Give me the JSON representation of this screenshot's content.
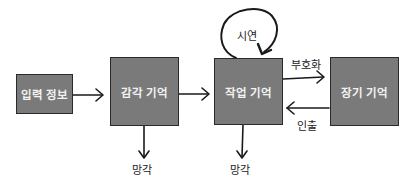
{
  "diagram": {
    "type": "memory-model-flow",
    "nodes": [
      {
        "id": "input",
        "label": "입력 정보"
      },
      {
        "id": "sensory",
        "label": "감각 기억"
      },
      {
        "id": "working",
        "label": "작업 기억"
      },
      {
        "id": "longterm",
        "label": "장기 기억"
      }
    ],
    "edges": [
      {
        "from": "input",
        "to": "sensory",
        "label": ""
      },
      {
        "from": "sensory",
        "to": "working",
        "label": ""
      },
      {
        "from": "working",
        "to": "working",
        "label": "시연"
      },
      {
        "from": "working",
        "to": "longterm",
        "label": "부호화"
      },
      {
        "from": "longterm",
        "to": "working",
        "label": "인출"
      },
      {
        "from": "sensory",
        "to": "forget",
        "label": "망각"
      },
      {
        "from": "working",
        "to": "forget",
        "label": "망각"
      }
    ],
    "labels": {
      "rehearsal": "시연",
      "encoding": "부호화",
      "retrieval": "인출",
      "forget_sensory": "망각",
      "forget_working": "망각"
    },
    "colors": {
      "box_fill": "#7a7a7a",
      "box_border": "#2a2a2a",
      "box_text": "#f2f2f2",
      "line": "#1a1a1a"
    }
  }
}
